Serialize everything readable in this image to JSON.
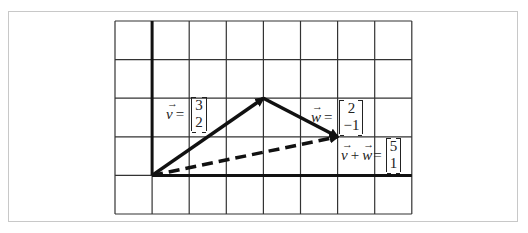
{
  "diagram": {
    "grid": {
      "columns": 8,
      "rows": 5,
      "x_left": 115,
      "y_top": 21,
      "cell_w": 37.1,
      "cell_h": 38.6,
      "origin_col": 1,
      "origin_row": 4
    },
    "colors": {
      "grid": "#333333",
      "axes": "#111111",
      "arrow": "#111111",
      "frame": "#c8c8c8"
    },
    "vectors": [
      {
        "id": "v",
        "name": "v",
        "components": [
          "3",
          "2"
        ],
        "style": "solid",
        "from": [
          0,
          0
        ],
        "to": [
          3,
          2
        ]
      },
      {
        "id": "w",
        "name": "w",
        "components": [
          "2",
          "−1"
        ],
        "style": "solid",
        "from": [
          3,
          2
        ],
        "to": [
          5,
          1
        ]
      },
      {
        "id": "sum",
        "name": "v + w",
        "components": [
          "5",
          "1"
        ],
        "style": "dashed",
        "from": [
          0,
          0
        ],
        "to": [
          5,
          1
        ]
      }
    ],
    "labels": {
      "v": {
        "symbol": "v",
        "arrow": "→",
        "eq": "=",
        "top": "3",
        "bottom": "2"
      },
      "w": {
        "symbol": "w",
        "arrow": "→",
        "eq": "=",
        "top": "2",
        "bottom": "−1"
      },
      "sum": {
        "symbol1": "v",
        "plus": "+",
        "symbol2": "w",
        "arrow": "→",
        "eq": "=",
        "top": "5",
        "bottom": "1"
      }
    }
  }
}
